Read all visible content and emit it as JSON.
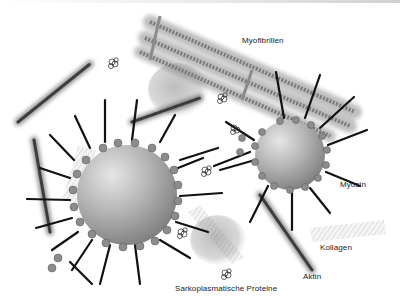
{
  "diagram": {
    "language": "de",
    "labels": {
      "myofibrils": "Myofibrillen",
      "myosin": "Myosin",
      "collagen": "Kollagen",
      "actin": "Aktin",
      "sarcoplasmic_proteins": "Sarkoplasmatische Proteine"
    },
    "colors": {
      "background": "#ffffff",
      "sphere_light": "#d8d8d8",
      "sphere_dark": "#8a8a8a",
      "filament": "#555555",
      "myosin_tail": "#111111",
      "text": "#222222"
    },
    "elements": [
      {
        "type": "fat-droplet",
        "label": "",
        "cx": 127,
        "cy": 195,
        "r": 50
      },
      {
        "type": "fat-droplet",
        "label": "",
        "cx": 290,
        "cy": 155,
        "r": 35
      },
      {
        "type": "myofibril-bundle",
        "label": "Myofibrillen"
      },
      {
        "type": "actin-filament",
        "label": "Aktin"
      },
      {
        "type": "collagen-fibre",
        "label": "Kollagen"
      },
      {
        "type": "sarcoplasmic-protein-blob",
        "label": "Sarkoplasmatische Proteine"
      },
      {
        "type": "myosin-molecule",
        "label": "Myosin"
      }
    ]
  }
}
